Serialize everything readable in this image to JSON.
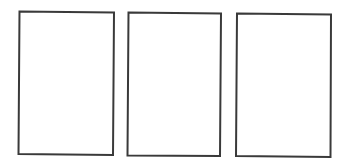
{
  "diagram": {
    "background": "#ffffff",
    "stroke_color": "#3a3a3a",
    "stroke_width": 2,
    "panels": [
      {
        "id": "panel-1",
        "points": "19.5,11.5 114,12.5 113,155 18.5,154"
      },
      {
        "id": "panel-2",
        "points": "128.5,12.5 221,13.5 220,156 127.5,155.5"
      },
      {
        "id": "panel-3",
        "points": "237,13.5 331,14.5 330.5,157 236,156"
      }
    ]
  }
}
